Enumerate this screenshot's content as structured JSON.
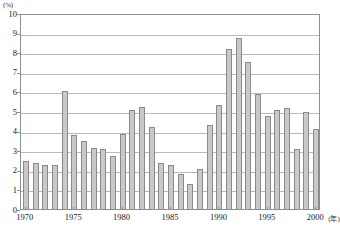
{
  "chart_data": {
    "type": "bar",
    "title": "",
    "subtitle": "",
    "xlabel": "(年)",
    "ylabel": "(%)",
    "ylim": [
      0,
      10
    ],
    "xlim": [
      1969.5,
      2000.5
    ],
    "grid": true,
    "legend": null,
    "y_ticks": [
      0,
      1,
      2,
      3,
      4,
      5,
      6,
      7,
      8,
      9,
      10
    ],
    "y_tick_labels": [
      "0",
      "1",
      "2",
      "3",
      "4",
      "5",
      "6",
      "7",
      "8",
      "9",
      "10"
    ],
    "x_ticks": [
      1970,
      1975,
      1980,
      1985,
      1990,
      1995,
      2000
    ],
    "x_tick_labels": [
      "1970",
      "1975",
      "1980",
      "1985",
      "1990",
      "1995",
      "2000"
    ],
    "categories": [
      "1970",
      "1971",
      "1972",
      "1973",
      "1974",
      "1975",
      "1976",
      "1977",
      "1978",
      "1979",
      "1980",
      "1981",
      "1982",
      "1983",
      "1984",
      "1985",
      "1986",
      "1987",
      "1988",
      "1989",
      "1990",
      "1991",
      "1992",
      "1993",
      "1994",
      "1995",
      "1996",
      "1997",
      "1998",
      "1999",
      "2000"
    ],
    "values": [
      2.45,
      2.35,
      2.25,
      2.25,
      6.0,
      3.8,
      3.45,
      3.1,
      3.05,
      2.7,
      3.85,
      5.05,
      5.2,
      4.2,
      2.35,
      2.25,
      1.8,
      1.3,
      2.05,
      4.3,
      5.3,
      8.15,
      8.75,
      7.5,
      5.85,
      4.75,
      5.05,
      5.15,
      3.05,
      4.95,
      4.1
    ],
    "bar_color": "#c9c9c9",
    "bar_border_color": "#8a8a8a",
    "grid_color": "#b9b9b9",
    "axis_color": "#8f8f8f",
    "background_color": "#ffffff"
  }
}
